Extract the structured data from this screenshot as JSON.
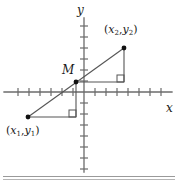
{
  "figure": {
    "name": "midpoint-formula-coordinate-diagram",
    "axes": {
      "x_label": "x",
      "y_label": "y",
      "origin": [
        84,
        92
      ],
      "x_axis": {
        "x_start": 4,
        "x_end": 172,
        "y": 92
      },
      "y_axis": {
        "y_start": 18,
        "y_end": 172,
        "x": 84
      },
      "tick_spacing": 11,
      "tick_half_length": 4,
      "x_ticks_left": 6,
      "x_ticks_right": 7,
      "y_ticks_up": 6,
      "y_ticks_down": 7
    },
    "points": [
      {
        "id": "p1",
        "label_parts": {
          "open": "(",
          "x": "x",
          "xsub": "1",
          "comma": ",",
          "y": "y",
          "ysub": "1",
          "close": ")"
        },
        "cx": 28,
        "cy": 117,
        "label_x": 6,
        "label_y": 125
      },
      {
        "id": "p2",
        "label_parts": {
          "open": "(",
          "x": "x",
          "xsub": "2",
          "comma": ",",
          "y": "y",
          "ysub": "2",
          "close": ")"
        },
        "cx": 124,
        "cy": 48,
        "label_x": 104,
        "label_y": 24
      },
      {
        "id": "m",
        "label": "M",
        "cx": 76,
        "cy": 82,
        "label_x": 62,
        "label_y": 64
      }
    ],
    "segments": {
      "hypotenuse": {
        "x1": 28,
        "y1": 117,
        "x2": 124,
        "y2": 48
      },
      "lower_horizontal_leg": {
        "x1": 28,
        "y1": 117,
        "x2": 76,
        "y2": 117
      },
      "lower_vertical_leg": {
        "x1": 76,
        "y1": 117,
        "x2": 76,
        "y2": 82
      },
      "upper_horizontal_leg": {
        "x1": 76,
        "y1": 82,
        "x2": 124,
        "y2": 82
      },
      "upper_vertical_leg": {
        "x1": 124,
        "y1": 82,
        "x2": 124,
        "y2": 48
      }
    },
    "right_angle_markers": [
      {
        "id": "lower-right-angle",
        "x": 69,
        "y": 110,
        "size": 7
      },
      {
        "id": "upper-right-angle",
        "x": 117,
        "y": 75,
        "size": 7
      }
    ],
    "colors": {
      "stroke": "#555555",
      "axis": "#6b6b6b",
      "point": "#111111",
      "text": "#1a1a1a",
      "rule": "#9a9a9a",
      "background": "#ffffff"
    }
  },
  "rules": {
    "rule_top_label": "horizontal-divider-upper",
    "rule_bottom_label": "horizontal-divider-lower"
  }
}
